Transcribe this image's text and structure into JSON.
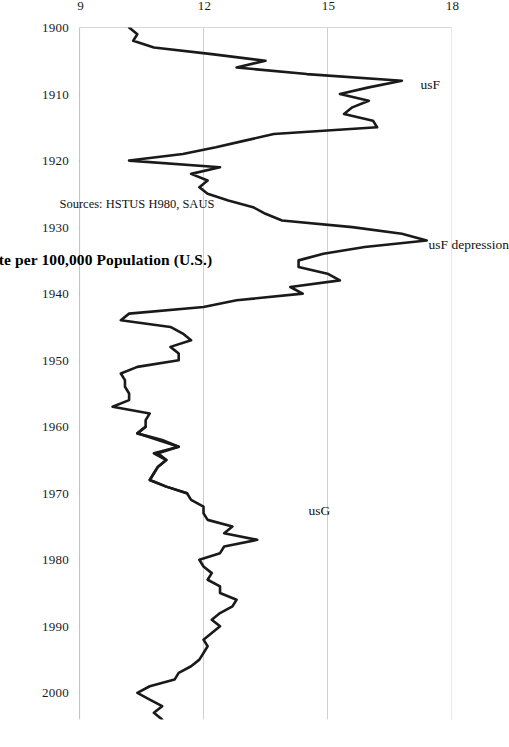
{
  "figure": {
    "caption": "Figure 6.11 - Suicide Rate per 100,000 Population (U.S.)",
    "source_note": "Sources: HSTUS H980, SAUS",
    "orientation": "rotated-90"
  },
  "annotations": {
    "usF": "usF",
    "usF_depression": "usF depression",
    "usG": "usG"
  },
  "chart_data": {
    "type": "line",
    "title": "Figure 6.11 - Suicide Rate per 100,000 Population (U.S.)",
    "xlabel": "",
    "ylabel": "",
    "xlim": [
      1900,
      2004
    ],
    "ylim": [
      9,
      18
    ],
    "y_ticks": [
      18,
      15,
      12,
      9
    ],
    "x_ticks": [
      1900,
      1910,
      1920,
      1930,
      1940,
      1950,
      1960,
      1970,
      1980,
      1990,
      2000
    ],
    "grid": "y-gridlines-only",
    "legend": "inline-annotations",
    "line_color": "#1a1a1a",
    "line_width": 2.6,
    "series": [
      {
        "name": "usF",
        "label": "usF",
        "note": "usF depression",
        "x": [
          1900,
          1901,
          1902,
          1903,
          1904,
          1905,
          1906,
          1907,
          1908,
          1909,
          1910,
          1911,
          1912,
          1913,
          1914,
          1915,
          1916,
          1917,
          1918,
          1919,
          1920,
          1921,
          1922,
          1923,
          1924,
          1925,
          1926,
          1927,
          1928,
          1929,
          1930,
          1931,
          1932,
          1933,
          1934,
          1935,
          1936,
          1937,
          1938,
          1939,
          1940,
          1941,
          1942,
          1943,
          1944,
          1945,
          1946,
          1947,
          1948,
          1949,
          1950,
          1951,
          1952,
          1953,
          1954,
          1955,
          1956,
          1957,
          1958,
          1959,
          1960,
          1961,
          1962,
          1963,
          1964,
          1965,
          1966,
          1967,
          1968,
          1969,
          1970
        ],
        "y": [
          10.2,
          10.4,
          10.3,
          10.8,
          12.2,
          13.5,
          12.8,
          14.5,
          16.8,
          16.0,
          15.3,
          16.0,
          15.6,
          15.4,
          16.1,
          16.2,
          13.7,
          13.0,
          12.3,
          11.5,
          10.2,
          12.4,
          11.7,
          12.1,
          11.9,
          12.1,
          12.6,
          13.2,
          13.5,
          13.9,
          15.6,
          16.8,
          17.4,
          15.9,
          14.9,
          14.3,
          14.3,
          15.0,
          15.3,
          14.1,
          14.4,
          12.8,
          12.0,
          10.2,
          10.0,
          11.2,
          11.5,
          11.7,
          11.2,
          11.4,
          11.4,
          10.4,
          10.0,
          10.1,
          10.1,
          10.2,
          10.2,
          9.8,
          10.7,
          10.6,
          10.6,
          10.4,
          10.9,
          11.4,
          10.9,
          11.1,
          10.9,
          10.8,
          10.7,
          11.1,
          11.6
        ],
        "style": "solid"
      },
      {
        "name": "usG",
        "label": "usG",
        "x": [
          1960,
          1961,
          1962,
          1963,
          1964,
          1965,
          1966,
          1967,
          1968,
          1969,
          1970,
          1971,
          1972,
          1973,
          1974,
          1975,
          1976,
          1977,
          1978,
          1979,
          1980,
          1981,
          1982,
          1983,
          1984,
          1985,
          1986,
          1987,
          1988,
          1989,
          1990,
          1991,
          1992,
          1993,
          1994,
          1995,
          1996,
          1997,
          1998,
          1999,
          2000,
          2001,
          2002,
          2003,
          2004
        ],
        "y": [
          10.6,
          10.4,
          11.0,
          11.4,
          10.8,
          11.1,
          10.9,
          10.8,
          10.7,
          11.1,
          11.6,
          11.7,
          12.0,
          12.0,
          12.1,
          12.7,
          12.5,
          13.3,
          12.5,
          12.4,
          11.9,
          12.0,
          12.2,
          12.1,
          12.4,
          12.4,
          12.8,
          12.7,
          12.4,
          12.2,
          12.4,
          12.2,
          12.0,
          12.1,
          12.0,
          11.9,
          11.7,
          11.4,
          11.3,
          10.7,
          10.4,
          10.7,
          11.0,
          10.8,
          11.0
        ],
        "style": "solid"
      }
    ]
  }
}
